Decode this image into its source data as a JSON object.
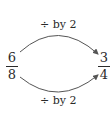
{
  "diagram": {
    "top_label": "÷ by 2",
    "bottom_label": "÷ by 2",
    "left_fraction": {
      "numerator": "6",
      "denominator": "8"
    },
    "right_fraction": {
      "numerator": "3",
      "denominator": "4"
    },
    "arrow_color": "#555555",
    "text_color": "#2a2a2a"
  }
}
